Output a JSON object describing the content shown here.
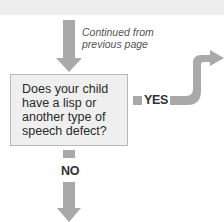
{
  "diagram": {
    "note": {
      "line1": "Continued from",
      "line2": "previous page"
    },
    "question": "Does your child have a lisp or another type of speech defect?",
    "branches": {
      "yes": "YES",
      "no": "NO"
    },
    "colors": {
      "arrow": "#a9a9a9",
      "box_fill": "#efefef",
      "box_border": "#b8b8b8",
      "band": "#eeeeee"
    }
  }
}
